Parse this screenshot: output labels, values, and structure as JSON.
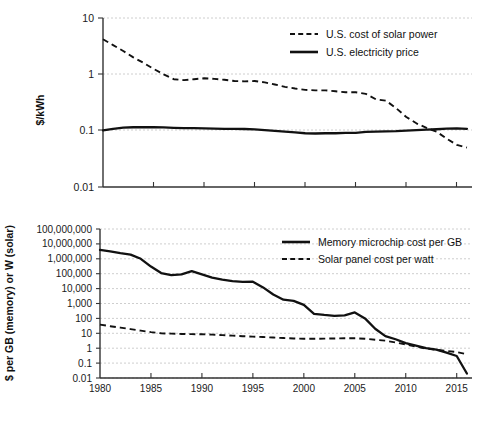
{
  "figure": {
    "panels": 2,
    "background": "#ffffff",
    "line_color": "#111111",
    "grid_color": "#c8c8c8"
  },
  "chart_data": [
    {
      "id": "top",
      "type": "line",
      "title": "",
      "xlabel": "",
      "ylabel": "$/kWh",
      "yscale": "log",
      "ylim": [
        0.01,
        10
      ],
      "ytick_labels": [
        "10",
        "1",
        "0.1",
        "0.01"
      ],
      "ytick_values": [
        10,
        1,
        0.1,
        0.01
      ],
      "xlim": [
        1980,
        2016.5
      ],
      "xtick_labels": [
        "1980",
        "1985",
        "1990",
        "1995",
        "2000",
        "2005",
        "2010",
        "2015"
      ],
      "xtick_values": [
        1980,
        1985,
        1990,
        1995,
        2000,
        2005,
        2010,
        2015
      ],
      "grid": true,
      "legend_position": "top-right",
      "series": [
        {
          "name": "U.S. cost of solar power",
          "style": "dashed",
          "x": [
            1980,
            1981,
            1982,
            1983,
            1984,
            1985,
            1986,
            1987,
            1988,
            1989,
            1990,
            1991,
            1992,
            1993,
            1994,
            1995,
            1996,
            1997,
            1998,
            1999,
            2000,
            2001,
            2002,
            2003,
            2004,
            2005,
            2006,
            2007,
            2008,
            2009,
            2010,
            2011,
            2012,
            2013,
            2014,
            2015,
            2016
          ],
          "values": [
            4.2,
            3.3,
            2.6,
            2.0,
            1.6,
            1.25,
            1.0,
            0.82,
            0.79,
            0.82,
            0.85,
            0.83,
            0.8,
            0.76,
            0.75,
            0.76,
            0.72,
            0.66,
            0.6,
            0.56,
            0.53,
            0.52,
            0.52,
            0.5,
            0.48,
            0.48,
            0.45,
            0.36,
            0.34,
            0.25,
            0.175,
            0.135,
            0.112,
            0.096,
            0.072,
            0.056,
            0.05
          ]
        },
        {
          "name": "U.S. electricity price",
          "style": "solid",
          "x": [
            1980,
            1981,
            1982,
            1983,
            1984,
            1985,
            1986,
            1987,
            1988,
            1989,
            1990,
            1991,
            1992,
            1993,
            1994,
            1995,
            1996,
            1997,
            1998,
            1999,
            2000,
            2001,
            2002,
            2003,
            2004,
            2005,
            2006,
            2007,
            2008,
            2009,
            2010,
            2011,
            2012,
            2013,
            2014,
            2015,
            2016
          ],
          "values": [
            0.101,
            0.108,
            0.113,
            0.115,
            0.116,
            0.115,
            0.114,
            0.112,
            0.111,
            0.111,
            0.11,
            0.109,
            0.108,
            0.108,
            0.107,
            0.105,
            0.102,
            0.099,
            0.096,
            0.093,
            0.09,
            0.089,
            0.09,
            0.09,
            0.091,
            0.091,
            0.095,
            0.096,
            0.097,
            0.098,
            0.1,
            0.102,
            0.104,
            0.106,
            0.109,
            0.11,
            0.108
          ]
        }
      ]
    },
    {
      "id": "bottom",
      "type": "line",
      "title": "",
      "xlabel": "",
      "ylabel": "$ per GB (memory) or W (solar)",
      "yscale": "log",
      "ylim": [
        0.01,
        100000000
      ],
      "ytick_labels": [
        "100,000,000",
        "10,000,000",
        "1,000,000",
        "100,000",
        "10,000",
        "1,000",
        "100",
        "10",
        "1",
        "0.1",
        "0.01"
      ],
      "ytick_values": [
        100000000,
        10000000,
        1000000,
        100000,
        10000,
        1000,
        100,
        10,
        1,
        0.1,
        0.01
      ],
      "xlim": [
        1980,
        2016.5
      ],
      "xtick_labels": [
        "1980",
        "1985",
        "1990",
        "1995",
        "2000",
        "2005",
        "2010",
        "2015"
      ],
      "xtick_values": [
        1980,
        1985,
        1990,
        1995,
        2000,
        2005,
        2010,
        2015
      ],
      "grid": true,
      "legend_position": "top-right",
      "series": [
        {
          "name": "Memory microchip cost per GB",
          "style": "solid",
          "x": [
            1980,
            1981,
            1982,
            1983,
            1984,
            1985,
            1986,
            1987,
            1988,
            1989,
            1990,
            1991,
            1992,
            1993,
            1994,
            1995,
            1996,
            1997,
            1998,
            1999,
            2000,
            2001,
            2002,
            2003,
            2004,
            2005,
            2006,
            2007,
            2008,
            2009,
            2010,
            2011,
            2012,
            2013,
            2014,
            2015,
            2016
          ],
          "values": [
            4000000,
            3200000,
            2400000,
            1900000,
            1000000,
            300000,
            110000,
            80000,
            90000,
            150000,
            90000,
            55000,
            40000,
            32000,
            28000,
            29000,
            12000,
            4000,
            1800,
            1500,
            800,
            200,
            170,
            150,
            160,
            250,
            100,
            20,
            6.5,
            4.0,
            2.2,
            1.5,
            1.0,
            0.8,
            0.5,
            0.3,
            0.02
          ]
        },
        {
          "name": "Solar panel cost per watt",
          "style": "dashed",
          "x": [
            1980,
            1981,
            1982,
            1983,
            1984,
            1985,
            1986,
            1987,
            1988,
            1989,
            1990,
            1991,
            1992,
            1993,
            1994,
            1995,
            1996,
            1997,
            1998,
            1999,
            2000,
            2001,
            2002,
            2003,
            2004,
            2005,
            2006,
            2007,
            2008,
            2009,
            2010,
            2011,
            2012,
            2013,
            2014,
            2015,
            2016
          ],
          "values": [
            38,
            30,
            24,
            19,
            15,
            12,
            10,
            9.5,
            9.0,
            8.8,
            8.6,
            8.2,
            7.6,
            7.0,
            6.4,
            6.0,
            5.6,
            5.2,
            4.8,
            4.5,
            4.3,
            4.3,
            4.4,
            4.5,
            4.6,
            4.6,
            4.3,
            3.7,
            3.2,
            2.4,
            1.8,
            1.3,
            0.95,
            0.78,
            0.65,
            0.55,
            0.4
          ]
        }
      ]
    }
  ]
}
